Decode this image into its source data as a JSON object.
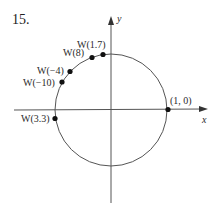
{
  "problem": {
    "number": "15."
  },
  "axes": {
    "x_label": "x",
    "y_label": "y"
  },
  "circle": {
    "cx": 111,
    "cy": 110,
    "r": 56,
    "stroke": "#555555"
  },
  "points": [
    {
      "label": "W(1.7)",
      "x": 103,
      "y": 54
    },
    {
      "label": "W(8)",
      "x": 92,
      "y": 57
    },
    {
      "label": "W(−4)",
      "x": 70,
      "y": 72
    },
    {
      "label": "W(−10)",
      "x": 62,
      "y": 82
    },
    {
      "label": "W(3.3)",
      "x": 55,
      "y": 118
    },
    {
      "label": "(1, 0)",
      "x": 168,
      "y": 109
    }
  ],
  "labels": {
    "w17": "W(1.7)",
    "w8": "W(8)",
    "wm4": "W(−4)",
    "wm10": "W(−10)",
    "w33": "W(3.3)",
    "p10": "(1, 0)"
  }
}
